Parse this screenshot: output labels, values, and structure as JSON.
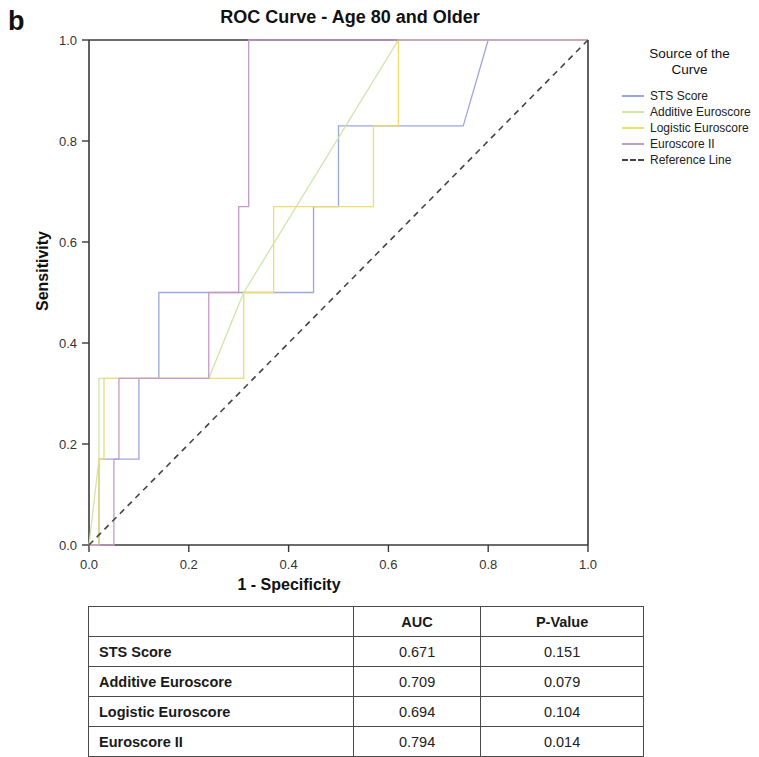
{
  "panel": {
    "letter": "b"
  },
  "chart_title": "ROC Curve - Age 80 and Older",
  "axes": {
    "xlabel": "1 - Specificity",
    "ylabel": "Sensitivity",
    "xticks": [
      "0.0",
      "0.2",
      "0.4",
      "0.6",
      "0.8",
      "1.0"
    ],
    "yticks": [
      "0.0",
      "0.2",
      "0.4",
      "0.6",
      "0.8",
      "1.0"
    ]
  },
  "legend": {
    "title_line1": "Source of the",
    "title_line2": "Curve",
    "items": [
      {
        "label": "STS Score",
        "color": "#9aa8dc",
        "dashed": false
      },
      {
        "label": "Additive Euroscore",
        "color": "#cfe6a8",
        "dashed": false
      },
      {
        "label": "Logistic Euroscore",
        "color": "#f2dc6a",
        "dashed": false
      },
      {
        "label": "Euroscore II",
        "color": "#c49ac8",
        "dashed": false
      },
      {
        "label": "Reference Line",
        "color": "#444444",
        "dashed": true
      }
    ]
  },
  "table": {
    "columns": [
      "",
      "AUC",
      "P-Value"
    ],
    "rows": [
      {
        "name": "STS Score",
        "auc": "0.671",
        "pvalue": "0.151"
      },
      {
        "name": "Additive Euroscore",
        "auc": "0.709",
        "pvalue": "0.079"
      },
      {
        "name": "Logistic Euroscore",
        "auc": "0.694",
        "pvalue": "0.104"
      },
      {
        "name": "Euroscore II",
        "auc": "0.794",
        "pvalue": "0.014"
      }
    ]
  },
  "chart_data": {
    "type": "line",
    "title": "ROC Curve - Age 80 and Older",
    "xlabel": "1 - Specificity",
    "ylabel": "Sensitivity",
    "xlim": [
      0.0,
      1.0
    ],
    "ylim": [
      0.0,
      1.0
    ],
    "grid": false,
    "legend_position": "right",
    "legend_title": "Source of the Curve",
    "series": [
      {
        "name": "STS Score",
        "color": "#9aa8dc",
        "auc": 0.671,
        "pvalue": 0.151,
        "points": [
          [
            0.0,
            0.0
          ],
          [
            0.02,
            0.0
          ],
          [
            0.02,
            0.17
          ],
          [
            0.1,
            0.17
          ],
          [
            0.1,
            0.33
          ],
          [
            0.14,
            0.33
          ],
          [
            0.14,
            0.5
          ],
          [
            0.45,
            0.5
          ],
          [
            0.45,
            0.67
          ],
          [
            0.5,
            0.67
          ],
          [
            0.5,
            0.83
          ],
          [
            0.75,
            0.83
          ],
          [
            0.8,
            1.0
          ],
          [
            1.0,
            1.0
          ]
        ]
      },
      {
        "name": "Additive Euroscore",
        "color": "#cfe6a8",
        "auc": 0.709,
        "pvalue": 0.079,
        "points": [
          [
            0.0,
            0.0
          ],
          [
            0.02,
            0.17
          ],
          [
            0.02,
            0.33
          ],
          [
            0.24,
            0.33
          ],
          [
            0.31,
            0.5
          ],
          [
            0.62,
            1.0
          ],
          [
            1.0,
            1.0
          ]
        ]
      },
      {
        "name": "Logistic Euroscore",
        "color": "#f2dc6a",
        "auc": 0.694,
        "pvalue": 0.104,
        "points": [
          [
            0.0,
            0.0
          ],
          [
            0.02,
            0.0
          ],
          [
            0.02,
            0.17
          ],
          [
            0.03,
            0.17
          ],
          [
            0.03,
            0.33
          ],
          [
            0.31,
            0.33
          ],
          [
            0.31,
            0.5
          ],
          [
            0.37,
            0.5
          ],
          [
            0.37,
            0.67
          ],
          [
            0.57,
            0.67
          ],
          [
            0.57,
            0.83
          ],
          [
            0.62,
            0.83
          ],
          [
            0.62,
            1.0
          ],
          [
            1.0,
            1.0
          ]
        ]
      },
      {
        "name": "Euroscore II",
        "color": "#c49ac8",
        "auc": 0.794,
        "pvalue": 0.014,
        "points": [
          [
            0.0,
            0.0
          ],
          [
            0.05,
            0.0
          ],
          [
            0.05,
            0.17
          ],
          [
            0.06,
            0.17
          ],
          [
            0.06,
            0.33
          ],
          [
            0.24,
            0.33
          ],
          [
            0.24,
            0.5
          ],
          [
            0.3,
            0.5
          ],
          [
            0.3,
            0.67
          ],
          [
            0.32,
            0.67
          ],
          [
            0.32,
            1.0
          ],
          [
            1.0,
            1.0
          ]
        ]
      },
      {
        "name": "Reference Line",
        "color": "#444444",
        "dashed": true,
        "points": [
          [
            0.0,
            0.0
          ],
          [
            1.0,
            1.0
          ]
        ]
      }
    ]
  }
}
